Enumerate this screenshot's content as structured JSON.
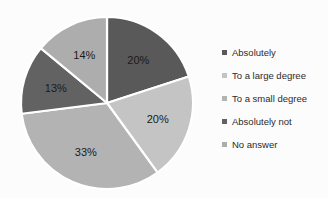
{
  "chart_data": {
    "type": "pie",
    "title": "",
    "subtitle": "",
    "xlabel": "",
    "ylabel": "",
    "grid": false,
    "legend_position": "right",
    "start_angle_deg": 0,
    "direction": "clockwise",
    "categories": [
      "Absolutely",
      "To a large degree",
      "To a small degree",
      "Absolutely not",
      "No answer"
    ],
    "values": [
      20,
      20,
      33,
      13,
      14
    ],
    "data_labels": [
      "20%",
      "20%",
      "33%",
      "13%",
      "14%"
    ],
    "colors": [
      "#595959",
      "#c4c4c4",
      "#b3b3b3",
      "#626262",
      "#adadad"
    ],
    "slice_label_color": "#1a1a1a",
    "separator_color": "#ffffff",
    "background_color": "#fcfcfc",
    "units": "percent"
  },
  "legend": {
    "items": [
      {
        "label": "Absolutely",
        "color": "#595959"
      },
      {
        "label": "To a large degree",
        "color": "#c4c4c4"
      },
      {
        "label": "To a small degree",
        "color": "#b3b3b3"
      },
      {
        "label": "Absolutely not",
        "color": "#626262"
      },
      {
        "label": "No answer",
        "color": "#adadad"
      }
    ]
  },
  "pie_geometry": {
    "center_x": 107,
    "center_y": 103,
    "radius": 86,
    "label_radius_fraction": 0.62
  }
}
